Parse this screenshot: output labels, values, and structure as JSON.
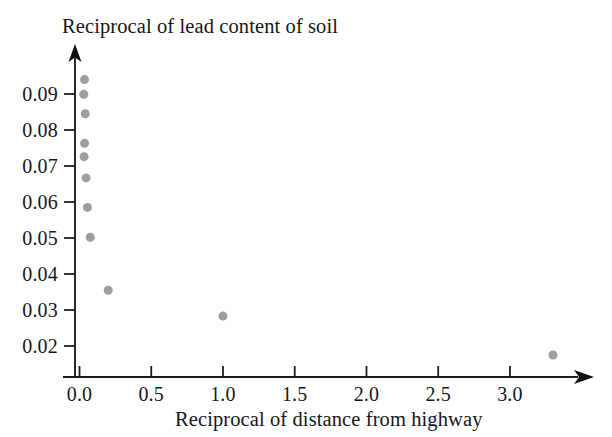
{
  "chart_data": {
    "type": "scatter",
    "title": "Reciprocal of lead content of soil",
    "xlabel": "Reciprocal of distance from highway",
    "ylabel": "Reciprocal of lead content of soil",
    "grid": false,
    "legend": null,
    "xlim": [
      -0.12,
      3.45
    ],
    "ylim": [
      0.0135,
      0.0985
    ],
    "xticks": [
      0.0,
      0.5,
      1.0,
      1.5,
      2.0,
      2.5,
      3.0
    ],
    "xtick_labels": [
      "0.0",
      "0.5",
      "1.0",
      "1.5",
      "2.0",
      "2.5",
      "3.0"
    ],
    "yticks": [
      0.02,
      0.03,
      0.04,
      0.05,
      0.06,
      0.07,
      0.08,
      0.09
    ],
    "ytick_labels": [
      "0.02",
      "0.03",
      "0.04",
      "0.05",
      "0.06",
      "0.07",
      "0.08",
      "0.09"
    ],
    "marker_color": "#9e9e9e",
    "marker_size": 9,
    "axis_color": "#1d1d1d",
    "points": [
      {
        "x": 0.035,
        "y": 0.094
      },
      {
        "x": 0.03,
        "y": 0.0899
      },
      {
        "x": 0.04,
        "y": 0.0845
      },
      {
        "x": 0.035,
        "y": 0.0763
      },
      {
        "x": 0.032,
        "y": 0.0726
      },
      {
        "x": 0.046,
        "y": 0.0667
      },
      {
        "x": 0.055,
        "y": 0.0585
      },
      {
        "x": 0.075,
        "y": 0.0502
      },
      {
        "x": 0.2,
        "y": 0.0355
      },
      {
        "x": 1.0,
        "y": 0.0283
      },
      {
        "x": 3.3,
        "y": 0.0175
      }
    ]
  },
  "figure": {
    "title_text": "Reciprocal of lead content of soil",
    "xaxis_title": "Reciprocal of distance from highway",
    "background_color": "#ffffff"
  }
}
